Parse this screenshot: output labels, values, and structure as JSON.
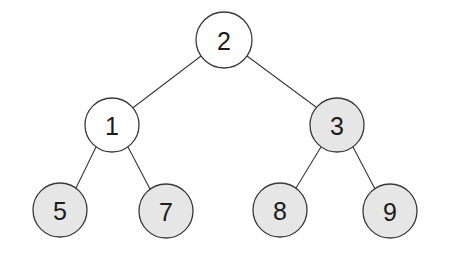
{
  "diagram": {
    "type": "tree",
    "background_color": "#ffffff",
    "edge_color": "#3d3d3d",
    "node_stroke_color": "#3a3a3a",
    "node_fill_white": "#ffffff",
    "node_fill_gray": "#e6e6e6",
    "label_color": "#1c1c1c",
    "node_radius": 27,
    "nodes": [
      {
        "id": "n2",
        "label": "2",
        "cx": 224,
        "cy": 40,
        "r": 28,
        "fill": "white",
        "level": 0,
        "role": "root"
      },
      {
        "id": "n1",
        "label": "1",
        "cx": 112,
        "cy": 125,
        "r": 27,
        "fill": "white",
        "level": 1,
        "role": "internal"
      },
      {
        "id": "n3",
        "label": "3",
        "cx": 337,
        "cy": 125,
        "r": 27,
        "fill": "gray",
        "level": 1,
        "role": "internal"
      },
      {
        "id": "n5",
        "label": "5",
        "cx": 60,
        "cy": 210,
        "r": 27,
        "fill": "gray",
        "level": 2,
        "role": "leaf"
      },
      {
        "id": "n7",
        "label": "7",
        "cx": 166,
        "cy": 211,
        "r": 27,
        "fill": "gray",
        "level": 2,
        "role": "leaf"
      },
      {
        "id": "n8",
        "label": "8",
        "cx": 280,
        "cy": 210,
        "r": 27,
        "fill": "gray",
        "level": 2,
        "role": "leaf"
      },
      {
        "id": "n9",
        "label": "9",
        "cx": 390,
        "cy": 211,
        "r": 27,
        "fill": "gray",
        "level": 2,
        "role": "leaf"
      }
    ],
    "edges": [
      {
        "id": "e-2-1",
        "from": "n2",
        "to": "n1",
        "x1": 201,
        "y1": 56,
        "x2": 130,
        "y2": 110
      },
      {
        "id": "e-2-3",
        "from": "n2",
        "to": "n3",
        "x1": 247,
        "y1": 56,
        "x2": 320,
        "y2": 110
      },
      {
        "id": "e-1-5",
        "from": "n1",
        "to": "n5",
        "x1": 96,
        "y1": 147,
        "x2": 76,
        "y2": 188
      },
      {
        "id": "e-1-7",
        "from": "n1",
        "to": "n7",
        "x1": 128,
        "y1": 147,
        "x2": 150,
        "y2": 189
      },
      {
        "id": "e-3-8",
        "from": "n3",
        "to": "n8",
        "x1": 321,
        "y1": 147,
        "x2": 296,
        "y2": 188
      },
      {
        "id": "e-3-9",
        "from": "n3",
        "to": "n9",
        "x1": 353,
        "y1": 147,
        "x2": 375,
        "y2": 189
      }
    ]
  }
}
